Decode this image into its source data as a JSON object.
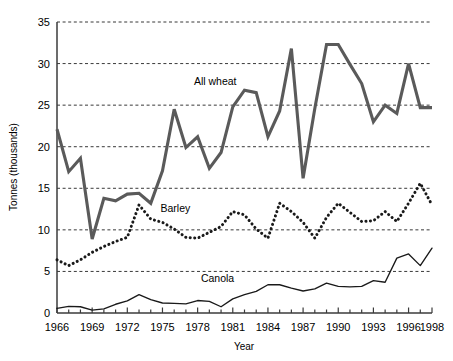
{
  "chart_data": {
    "type": "line",
    "title": "",
    "xlabel": "Year",
    "ylabel": "Tonnes (thousands)",
    "xlim": [
      1966,
      1998
    ],
    "ylim": [
      0,
      35
    ],
    "ytick_values": [
      0,
      5,
      10,
      15,
      20,
      25,
      30,
      35
    ],
    "ytick_labels": [
      "0",
      "5",
      "10",
      "15",
      "20",
      "25",
      "30",
      "35"
    ],
    "xtick_values": [
      1966,
      1969,
      1972,
      1975,
      1978,
      1981,
      1984,
      1987,
      1990,
      1993,
      1996,
      1998
    ],
    "xtick_labels": [
      "1966",
      "1969",
      "1972",
      "1975",
      "1978",
      "1981",
      "1984",
      "1987",
      "1990",
      "1993",
      "1996",
      "1998"
    ],
    "minor_xticks_every": 1,
    "grid": "horizontal-dashed",
    "legend": "inline-labels",
    "x": [
      1966,
      1967,
      1968,
      1969,
      1970,
      1971,
      1972,
      1973,
      1974,
      1975,
      1976,
      1977,
      1978,
      1979,
      1980,
      1981,
      1982,
      1983,
      1984,
      1985,
      1986,
      1987,
      1988,
      1989,
      1990,
      1991,
      1992,
      1993,
      1994,
      1995,
      1996,
      1997,
      1998
    ],
    "series": [
      {
        "name": "All wheat",
        "color": "#5a5a5a",
        "style": "solid-thick",
        "label_x": 1979.5,
        "label_y": 27.4,
        "values": [
          22.1,
          17.0,
          18.6,
          8.9,
          13.8,
          13.5,
          14.3,
          14.4,
          13.2,
          17.1,
          24.5,
          19.9,
          21.2,
          17.4,
          19.3,
          24.8,
          26.8,
          26.5,
          21.2,
          24.3,
          31.8,
          16.2,
          24.6,
          32.3,
          32.3,
          29.9,
          27.6,
          23.0,
          25.0,
          24.0,
          30.0,
          24.7,
          24.7
        ]
      },
      {
        "name": "Barley",
        "color": "#1a1a1a",
        "style": "dotted",
        "label_x": 1976.1,
        "label_y": 12.1,
        "values": [
          6.4,
          5.7,
          6.4,
          7.3,
          8.0,
          8.6,
          9.1,
          13.0,
          11.3,
          10.9,
          10.1,
          9.1,
          9.0,
          9.7,
          10.4,
          12.2,
          11.8,
          10.1,
          9.0,
          13.2,
          12.2,
          10.9,
          9.0,
          11.5,
          13.2,
          12.1,
          11.0,
          11.1,
          12.2,
          11.0,
          13.2,
          15.6,
          13.0
        ]
      },
      {
        "name": "Canola",
        "color": "#1a1a1a",
        "style": "solid-thin",
        "label_x": 1979.7,
        "label_y": 3.7,
        "values": [
          0.55,
          0.8,
          0.75,
          0.35,
          0.5,
          1.05,
          1.45,
          2.2,
          1.6,
          1.2,
          1.15,
          1.1,
          1.5,
          1.4,
          0.75,
          1.7,
          2.2,
          2.6,
          3.4,
          3.4,
          3.0,
          2.65,
          2.9,
          3.6,
          3.2,
          3.15,
          3.2,
          3.9,
          3.7,
          6.6,
          7.1,
          5.7,
          7.8
        ]
      }
    ]
  },
  "layout": {
    "plot_left_px": 57,
    "plot_right_px": 432,
    "plot_top_px": 22,
    "plot_bottom_px": 313
  }
}
